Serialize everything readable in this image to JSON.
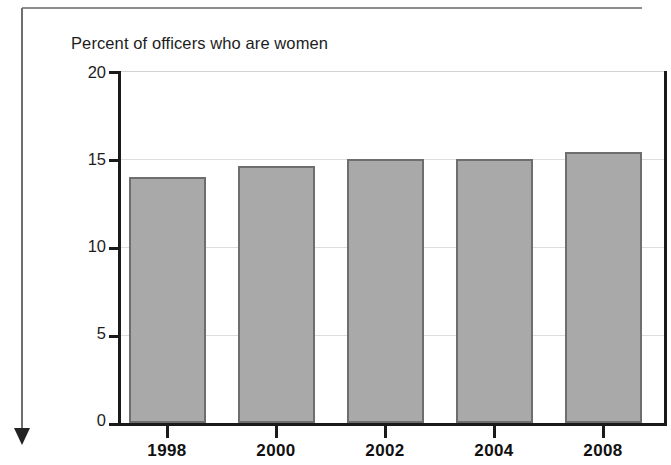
{
  "chart_data": {
    "type": "bar",
    "title": "Percent of officers who are women",
    "xlabel": "",
    "ylabel": "",
    "categories": [
      "1998",
      "2000",
      "2002",
      "2004",
      "2008"
    ],
    "values": [
      14.0,
      14.6,
      15.0,
      15.0,
      15.4
    ],
    "ylim": [
      0,
      20
    ],
    "yticks": [
      "0",
      "5",
      "10",
      "15",
      "20"
    ],
    "ytick_values": [
      0,
      5,
      10,
      15,
      20
    ],
    "grid": true,
    "legend": "none",
    "bar_color": "#a9a9a9",
    "bar_edge_color": "#6e6e6e",
    "axis_color": "#1a1a1a",
    "grid_color": "#dddddd"
  },
  "decorations": {
    "top_rule": "horizontal-rule",
    "left_rule": "vertical-rule",
    "arrow": "down-arrow"
  }
}
